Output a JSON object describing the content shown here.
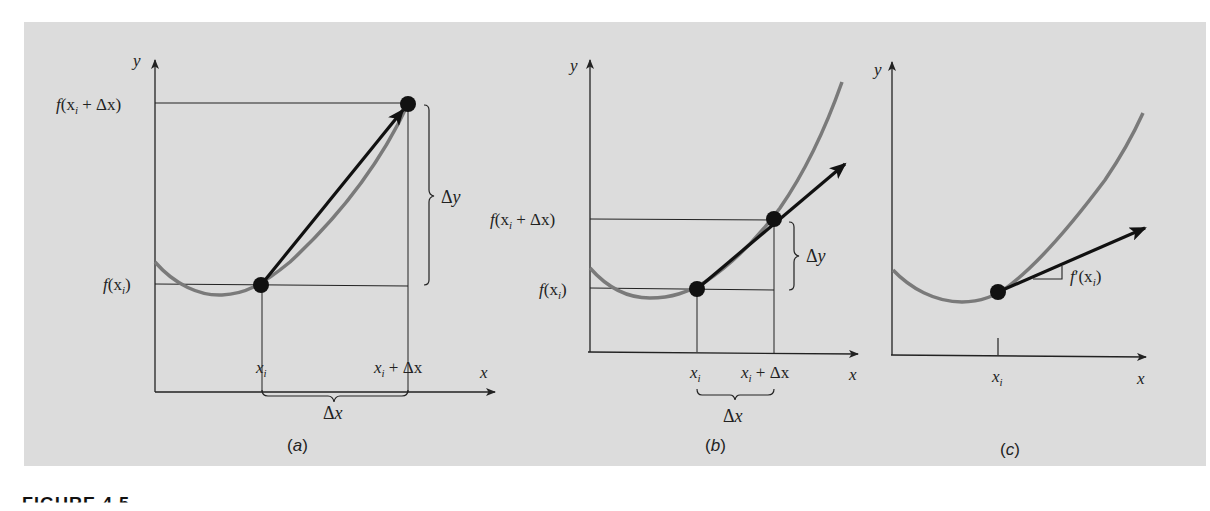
{
  "figure": {
    "background_color": "#dcdcdc",
    "curve_color": "#7a7a7a",
    "line_color": "#222222",
    "footer_label": "FIGURE 4.5"
  },
  "panels": [
    {
      "id": "a",
      "caption": "(a)",
      "axis_y_label": "y",
      "axis_x_label": "x",
      "y_tick_labels": [
        "f(xi + Δx)",
        "f(xi)"
      ],
      "x_tick_labels": [
        "xi",
        "xi + Δx"
      ],
      "brace_y_label": "Δy",
      "brace_x_label": "Δx",
      "description": "Secant from (xi, f(xi)) to (xi+Δx, f(xi+Δx)) with large Δx"
    },
    {
      "id": "b",
      "caption": "(b)",
      "axis_y_label": "y",
      "axis_x_label": "x",
      "y_tick_labels": [
        "f(xi + Δx)",
        "f(xi)"
      ],
      "x_tick_labels": [
        "xi",
        "xi + Δx"
      ],
      "brace_y_label": "Δy",
      "brace_x_label": "Δx",
      "description": "Secant with smaller Δx approaching tangent"
    },
    {
      "id": "c",
      "caption": "(c)",
      "axis_y_label": "y",
      "axis_x_label": "x",
      "x_tick_labels": [
        "xi"
      ],
      "slope_label": "f′(xi)",
      "description": "Tangent line at xi with slope f′(xi)"
    }
  ],
  "labels": {
    "a_y": "y",
    "a_x": "x",
    "a_fxdx_f": "f",
    "a_fxdx_open": "(x",
    "a_fxdx_sub": "i",
    "a_fxdx_rest": " + Δx)",
    "a_fx_f": "f",
    "a_fx_open": "(x",
    "a_fx_sub": "i",
    "a_fx_close": ")",
    "a_xi": "x",
    "a_xi_sub": "i",
    "a_xidx": "x",
    "a_xidx_sub": "i",
    "a_xidx_rest": " + Δx",
    "a_dy_delta": "Δ",
    "a_dy_var": "y",
    "a_dx_delta": "Δ",
    "a_dx_var": "x",
    "a_caption_open": "(",
    "a_caption_letter": "a",
    "a_caption_close": ")",
    "b_y": "y",
    "b_x": "x",
    "b_fxdx_f": "f",
    "b_fxdx_open": "(x",
    "b_fxdx_sub": "i",
    "b_fxdx_rest": " + Δx)",
    "b_fx_f": "f",
    "b_fx_open": "(x",
    "b_fx_sub": "i",
    "b_fx_close": ")",
    "b_xi": "x",
    "b_xi_sub": "i",
    "b_xidx": "x",
    "b_xidx_sub": "i",
    "b_xidx_rest": " + Δx",
    "b_dy_delta": "Δ",
    "b_dy_var": "y",
    "b_dx_delta": "Δ",
    "b_dx_var": "x",
    "b_caption_open": "(",
    "b_caption_letter": "b",
    "b_caption_close": ")",
    "c_y": "y",
    "c_x": "x",
    "c_xi": "x",
    "c_xi_sub": "i",
    "c_slope_f": "f",
    "c_slope_prime": "′",
    "c_slope_open": "(x",
    "c_slope_sub": "i",
    "c_slope_close": ")",
    "c_caption_open": "(",
    "c_caption_letter": "c",
    "c_caption_close": ")"
  }
}
